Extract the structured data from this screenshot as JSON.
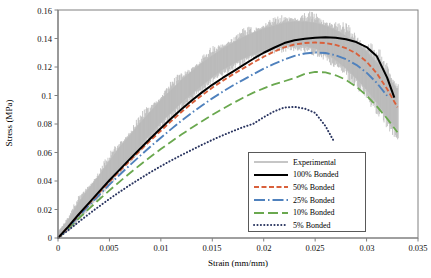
{
  "chart_data": {
    "type": "line",
    "title": "",
    "xlabel": "Strain (mm/mm)",
    "ylabel": "Stress (MPa)",
    "xlim": [
      0,
      0.035
    ],
    "ylim": [
      0,
      0.16
    ],
    "xticks": [
      "0",
      "0.005",
      "0.01",
      "0.015",
      "0.02",
      "0.025",
      "0.03",
      "0.035"
    ],
    "yticks": [
      "0",
      "0.02",
      "0.04",
      "0.06",
      "0.08",
      "0.1",
      "0.12",
      "0.14",
      "0.16"
    ],
    "xtick_values": [
      0,
      0.005,
      0.01,
      0.015,
      0.02,
      0.025,
      0.03,
      0.035
    ],
    "ytick_values": [
      0,
      0.02,
      0.04,
      0.06,
      0.08,
      0.1,
      0.12,
      0.14,
      0.16
    ],
    "grid": false,
    "legend_position": "lower-right-inside",
    "series": [
      {
        "name": "Experimental",
        "color": "#b3b3b3",
        "style": "noisy-band",
        "x": [
          0,
          0.001,
          0.002,
          0.003,
          0.004,
          0.005,
          0.006,
          0.007,
          0.008,
          0.009,
          0.01,
          0.011,
          0.012,
          0.013,
          0.014,
          0.015,
          0.016,
          0.017,
          0.018,
          0.019,
          0.02,
          0.021,
          0.022,
          0.023,
          0.024,
          0.025,
          0.026,
          0.027,
          0.028,
          0.029,
          0.03,
          0.031,
          0.032,
          0.033
        ],
        "upper": [
          0.004,
          0.013,
          0.025,
          0.035,
          0.044,
          0.054,
          0.064,
          0.072,
          0.081,
          0.089,
          0.097,
          0.104,
          0.111,
          0.117,
          0.123,
          0.128,
          0.133,
          0.137,
          0.141,
          0.144,
          0.147,
          0.149,
          0.151,
          0.152,
          0.152,
          0.151,
          0.149,
          0.146,
          0.142,
          0.137,
          0.131,
          0.123,
          0.114,
          0.104
        ],
        "lower": [
          0.0,
          0.006,
          0.014,
          0.023,
          0.031,
          0.04,
          0.049,
          0.057,
          0.065,
          0.073,
          0.081,
          0.088,
          0.095,
          0.101,
          0.107,
          0.113,
          0.118,
          0.122,
          0.126,
          0.129,
          0.132,
          0.134,
          0.135,
          0.136,
          0.135,
          0.133,
          0.13,
          0.125,
          0.119,
          0.112,
          0.104,
          0.095,
          0.085,
          0.076
        ]
      },
      {
        "name": "100% Bonded",
        "color": "#000000",
        "style": "solid",
        "x": [
          0,
          0.001,
          0.002,
          0.003,
          0.004,
          0.005,
          0.006,
          0.007,
          0.008,
          0.009,
          0.01,
          0.011,
          0.012,
          0.013,
          0.014,
          0.015,
          0.016,
          0.017,
          0.018,
          0.019,
          0.02,
          0.021,
          0.022,
          0.023,
          0.024,
          0.025,
          0.026,
          0.027,
          0.028,
          0.029,
          0.03,
          0.031,
          0.032,
          0.0327
        ],
        "y": [
          0.0,
          0.008,
          0.0165,
          0.0245,
          0.0325,
          0.0405,
          0.048,
          0.0555,
          0.0628,
          0.07,
          0.077,
          0.0838,
          0.0903,
          0.0965,
          0.1022,
          0.1075,
          0.1123,
          0.1168,
          0.1213,
          0.1258,
          0.13,
          0.1335,
          0.1368,
          0.1388,
          0.1398,
          0.1405,
          0.1408,
          0.1405,
          0.1395,
          0.1375,
          0.134,
          0.1275,
          0.1125,
          0.0985
        ]
      },
      {
        "name": "50% Bonded",
        "color": "#d9603b",
        "style": "dashed",
        "x": [
          0,
          0.001,
          0.002,
          0.003,
          0.004,
          0.005,
          0.006,
          0.007,
          0.008,
          0.009,
          0.01,
          0.011,
          0.012,
          0.013,
          0.014,
          0.015,
          0.016,
          0.017,
          0.018,
          0.019,
          0.02,
          0.021,
          0.022,
          0.023,
          0.024,
          0.025,
          0.026,
          0.027,
          0.028,
          0.029,
          0.03,
          0.031,
          0.032,
          0.033
        ],
        "y": [
          0.0,
          0.0078,
          0.0162,
          0.024,
          0.0318,
          0.0396,
          0.047,
          0.0543,
          0.0615,
          0.0685,
          0.0753,
          0.082,
          0.0884,
          0.0945,
          0.1002,
          0.1055,
          0.1103,
          0.1148,
          0.119,
          0.1232,
          0.1272,
          0.1308,
          0.1338,
          0.1358,
          0.1368,
          0.1372,
          0.1368,
          0.1355,
          0.1332,
          0.1295,
          0.1238,
          0.1155,
          0.1045,
          0.0918
        ]
      },
      {
        "name": "25% Bonded",
        "color": "#4f81bd",
        "style": "dash-dot",
        "x": [
          0,
          0.001,
          0.002,
          0.003,
          0.004,
          0.005,
          0.006,
          0.007,
          0.008,
          0.009,
          0.01,
          0.011,
          0.012,
          0.013,
          0.014,
          0.015,
          0.016,
          0.017,
          0.018,
          0.019,
          0.02,
          0.021,
          0.022,
          0.023,
          0.024,
          0.025,
          0.026,
          0.027,
          0.028,
          0.029,
          0.03,
          0.031,
          0.032
        ],
        "y": [
          0.0,
          0.0074,
          0.0152,
          0.0228,
          0.0302,
          0.0374,
          0.0444,
          0.0512,
          0.0578,
          0.0642,
          0.0704,
          0.0764,
          0.0822,
          0.0878,
          0.093,
          0.098,
          0.1026,
          0.107,
          0.111,
          0.115,
          0.1188,
          0.1222,
          0.1252,
          0.1278,
          0.1295,
          0.1302,
          0.1298,
          0.1282,
          0.1255,
          0.1215,
          0.116,
          0.1088,
          0.0998
        ]
      },
      {
        "name": "10% Bonded",
        "color": "#6aa84f",
        "style": "long-dashed",
        "x": [
          0,
          0.001,
          0.002,
          0.003,
          0.004,
          0.005,
          0.006,
          0.007,
          0.008,
          0.009,
          0.01,
          0.011,
          0.012,
          0.013,
          0.014,
          0.015,
          0.016,
          0.017,
          0.018,
          0.019,
          0.02,
          0.021,
          0.022,
          0.023,
          0.024,
          0.025,
          0.026,
          0.027,
          0.028,
          0.029,
          0.03,
          0.031,
          0.032,
          0.033
        ],
        "y": [
          0.0,
          0.0066,
          0.0136,
          0.0204,
          0.027,
          0.0334,
          0.0396,
          0.0456,
          0.0514,
          0.057,
          0.0624,
          0.0676,
          0.0726,
          0.0774,
          0.082,
          0.0864,
          0.0906,
          0.0946,
          0.0984,
          0.102,
          0.105,
          0.1078,
          0.11,
          0.1122,
          0.1152,
          0.1166,
          0.1162,
          0.1142,
          0.111,
          0.1062,
          0.1,
          0.0924,
          0.0838,
          0.0742
        ]
      },
      {
        "name": "5% Bonded",
        "color": "#2a3560",
        "style": "dotted",
        "x": [
          0,
          0.001,
          0.002,
          0.003,
          0.004,
          0.005,
          0.006,
          0.007,
          0.008,
          0.009,
          0.01,
          0.011,
          0.012,
          0.013,
          0.014,
          0.015,
          0.016,
          0.017,
          0.018,
          0.019,
          0.02,
          0.021,
          0.022,
          0.023,
          0.024,
          0.025,
          0.026,
          0.0268
        ],
        "y": [
          0.0,
          0.0055,
          0.0112,
          0.0168,
          0.0222,
          0.0274,
          0.0324,
          0.0372,
          0.0418,
          0.0462,
          0.0504,
          0.0544,
          0.0582,
          0.0618,
          0.0654,
          0.0688,
          0.072,
          0.075,
          0.0778,
          0.0802,
          0.0848,
          0.0888,
          0.0916,
          0.092,
          0.0908,
          0.0878,
          0.0786,
          0.0682
        ]
      }
    ]
  },
  "legend": {
    "items": [
      {
        "label": "Experimental",
        "color": "#b3b3b3",
        "style": "solid-thin"
      },
      {
        "label": "100% Bonded",
        "color": "#000000",
        "style": "solid"
      },
      {
        "label": "50% Bonded",
        "color": "#d9603b",
        "style": "dashed"
      },
      {
        "label": "25% Bonded",
        "color": "#4f81bd",
        "style": "dash-dot"
      },
      {
        "label": "10% Bonded",
        "color": "#6aa84f",
        "style": "long-dashed"
      },
      {
        "label": "5% Bonded",
        "color": "#2a3560",
        "style": "dotted"
      }
    ]
  },
  "axes": {
    "x_title": "Strain (mm/mm)",
    "y_title": "Stress (MPa)"
  },
  "colors": {
    "axis": "#808080",
    "experimental": "#b3b3b3",
    "bonded100": "#000000",
    "bonded50": "#d9603b",
    "bonded25": "#4f81bd",
    "bonded10": "#6aa84f",
    "bonded5": "#2a3560"
  }
}
